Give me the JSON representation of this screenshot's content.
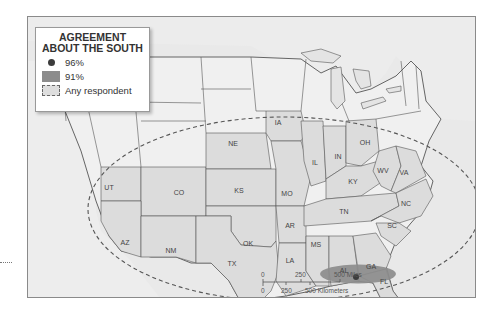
{
  "legend": {
    "title_line1": "AGREEMENT",
    "title_line2": "ABOUT THE SOUTH",
    "items": [
      {
        "symbol": "dot",
        "label": "96%"
      },
      {
        "symbol": "stipple",
        "label": "91%"
      },
      {
        "symbol": "dashed-outline",
        "label": "Any respondent"
      }
    ]
  },
  "state_labels": [
    {
      "abbr": "UT",
      "x": 108,
      "y": 189
    },
    {
      "abbr": "CO",
      "x": 178,
      "y": 194
    },
    {
      "abbr": "AZ",
      "x": 124,
      "y": 244
    },
    {
      "abbr": "NM",
      "x": 170,
      "y": 252
    },
    {
      "abbr": "NE",
      "x": 232,
      "y": 145
    },
    {
      "abbr": "KS",
      "x": 238,
      "y": 192
    },
    {
      "abbr": "OK",
      "x": 247,
      "y": 245
    },
    {
      "abbr": "TX",
      "x": 231,
      "y": 303
    },
    {
      "abbr": "IA",
      "x": 277,
      "y": 124
    },
    {
      "abbr": "MO",
      "x": 286,
      "y": 195
    },
    {
      "abbr": "AR",
      "x": 289,
      "y": 244
    },
    {
      "abbr": "LA",
      "x": 289,
      "y": 298
    },
    {
      "abbr": "MS",
      "x": 315,
      "y": 264
    },
    {
      "abbr": "AL",
      "x": 343,
      "y": 275
    },
    {
      "abbr": "GA",
      "x": 370,
      "y": 268
    },
    {
      "abbr": "FL",
      "x": 383,
      "y": 298
    },
    {
      "abbr": "IL",
      "x": 314,
      "y": 164
    },
    {
      "abbr": "IN",
      "x": 337,
      "y": 158
    },
    {
      "abbr": "OH",
      "x": 364,
      "y": 144
    },
    {
      "abbr": "KY",
      "x": 352,
      "y": 172
    },
    {
      "abbr": "TN",
      "x": 343,
      "y": 210
    },
    {
      "abbr": "WV",
      "x": 382,
      "y": 180
    },
    {
      "abbr": "VA",
      "x": 403,
      "y": 182
    },
    {
      "abbr": "NC",
      "x": 405,
      "y": 205
    },
    {
      "abbr": "SC",
      "x": 391,
      "y": 227
    }
  ],
  "scale_bar": {
    "miles_ticks": [
      "0",
      "250",
      "500 Miles"
    ],
    "km_ticks": [
      "0",
      "250",
      "500 Kilometers"
    ]
  },
  "colors": {
    "land_region": "#e3e3e3",
    "us_states": "#dcdcdc",
    "water": "#e9e9e9",
    "stipple_91": "#8c8c8c",
    "dot_96": "#3c3c3c",
    "border": "#555555"
  }
}
